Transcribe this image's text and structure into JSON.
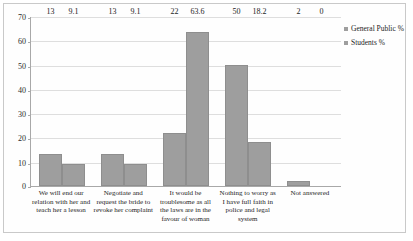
{
  "chart_data": {
    "type": "bar",
    "title": "",
    "subtitle": "",
    "xlabel": "",
    "ylabel": "",
    "ylim": [
      0,
      70
    ],
    "yticks": [
      0,
      10,
      20,
      30,
      40,
      50,
      60,
      70
    ],
    "grid": true,
    "legend_position": "right",
    "categories": [
      "We will end our relation with her and teach her a lesson",
      "Negotiate and request the bride to revoke her complaint",
      "It would be troublesome as all the laws are in the favour of  woman",
      "Nothing to worry as I have full faith in police and legal system",
      "Not answered"
    ],
    "series": [
      {
        "name": "General Public %",
        "color": "#9e9e9e",
        "values": [
          13,
          13,
          22,
          50,
          2
        ],
        "labels": [
          "13",
          "13",
          "22",
          "50",
          "2"
        ]
      },
      {
        "name": "Students %",
        "color": "#9e9e9e",
        "values": [
          9.1,
          9.1,
          63.6,
          18.2,
          0
        ],
        "labels": [
          "9.1",
          "9.1",
          "63.6",
          "18.2",
          "0"
        ]
      }
    ]
  },
  "legend": {
    "items": [
      {
        "label": "General Public %"
      },
      {
        "label": "Students %"
      }
    ]
  },
  "axis": {
    "y": {
      "ticks": [
        "0",
        "10",
        "20",
        "30",
        "40",
        "50",
        "60",
        "70"
      ]
    }
  },
  "colors": {
    "bar_fill": "#9e9e9e",
    "bar_stroke": "#8e8e8e",
    "gridline": "#dedede",
    "axis_line": "#a8a8a8",
    "frame_border": "#c9c9c9",
    "text": "#1d1d1d",
    "background": "#ffffff"
  }
}
